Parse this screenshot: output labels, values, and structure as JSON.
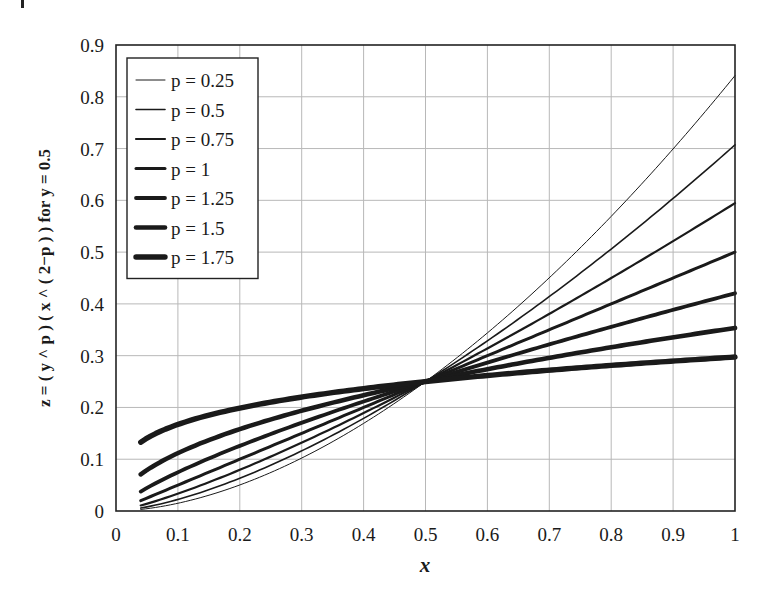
{
  "chart_data": {
    "type": "line",
    "title": "",
    "xlabel": "x",
    "ylabel": "z = ( y ^ p ) ( x ^ ( 2−p ) ) for y = 0.5",
    "xlim": [
      0,
      1
    ],
    "ylim": [
      0,
      0.9
    ],
    "xticks": [
      "0",
      "0.1",
      "0.2",
      "0.3",
      "0.4",
      "0.5",
      "0.6",
      "0.7",
      "0.8",
      "0.9",
      "1"
    ],
    "yticks": [
      "0",
      "0.1",
      "0.2",
      "0.3",
      "0.4",
      "0.5",
      "0.6",
      "0.7",
      "0.8",
      "0.9"
    ],
    "grid": true,
    "legend_position": "upper left",
    "x": [
      0.04,
      0.1,
      0.2,
      0.3,
      0.4,
      0.5,
      0.6,
      0.7,
      0.8,
      0.9,
      1.0
    ],
    "series": [
      {
        "name": "p = 0.25",
        "p": 0.25,
        "width": 1.0,
        "values": [
          0.003,
          0.0149,
          0.0493,
          0.1,
          0.1671,
          0.25,
          0.3486,
          0.4625,
          0.5917,
          0.7363,
          0.8409
        ]
      },
      {
        "name": "p = 0.5",
        "p": 0.5,
        "width": 1.6,
        "values": [
          0.0057,
          0.0224,
          0.0632,
          0.1162,
          0.1789,
          0.25,
          0.3286,
          0.4141,
          0.506,
          0.6037,
          0.7071
        ]
      },
      {
        "name": "p = 0.75",
        "p": 0.75,
        "width": 2.2,
        "values": [
          0.0106,
          0.0334,
          0.0795,
          0.132,
          0.1892,
          0.25,
          0.3139,
          0.3805,
          0.4494,
          0.5204,
          0.5946
        ]
      },
      {
        "name": "p = 1",
        "p": 1.0,
        "width": 3.0,
        "values": [
          0.02,
          0.05,
          0.1,
          0.15,
          0.2,
          0.25,
          0.3,
          0.35,
          0.4,
          0.45,
          0.5
        ]
      },
      {
        "name": "p = 1.25",
        "p": 1.25,
        "width": 3.8,
        "values": [
          0.0376,
          0.0748,
          0.1257,
          0.1704,
          0.2115,
          0.25,
          0.2867,
          0.3218,
          0.3556,
          0.3883,
          0.4204
        ]
      },
      {
        "name": "p = 1.5",
        "p": 1.5,
        "width": 4.6,
        "values": [
          0.0707,
          0.1118,
          0.1581,
          0.1936,
          0.2236,
          0.25,
          0.2739,
          0.2958,
          0.3162,
          0.3354,
          0.3536
        ]
      },
      {
        "name": "p = 1.75",
        "p": 1.75,
        "width": 5.4,
        "values": [
          0.133,
          0.1672,
          0.1988,
          0.2201,
          0.2365,
          0.25,
          0.2616,
          0.2719,
          0.2811,
          0.2895,
          0.2973
        ]
      }
    ]
  },
  "colors": {
    "line": "#1a1a1a",
    "grid": "#b8b8b8",
    "frame": "#222222",
    "background": "#ffffff"
  }
}
